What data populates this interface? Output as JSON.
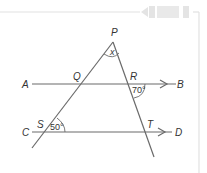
{
  "diagram": {
    "type": "geometry-parallel-lines-transversals",
    "points": {
      "P": "P",
      "Q": "Q",
      "R": "R",
      "S": "S",
      "T": "T",
      "A": "A",
      "B": "B",
      "C": "C",
      "D": "D"
    },
    "angles": {
      "apex": "x",
      "at_R": "70°",
      "at_S": "50°"
    },
    "lines": [
      {
        "name": "AB",
        "from": "A",
        "to": "B",
        "arrow": true
      },
      {
        "name": "CD",
        "from": "C",
        "to": "D",
        "arrow": true
      },
      {
        "name": "PS",
        "through": [
          "P",
          "Q",
          "S"
        ]
      },
      {
        "name": "PT",
        "through": [
          "P",
          "R",
          "T"
        ]
      }
    ],
    "colors": {
      "line": "#6a6a6a",
      "frame": "#dcdcdc",
      "tab": "#e6e6e6",
      "text": "#333333"
    }
  }
}
